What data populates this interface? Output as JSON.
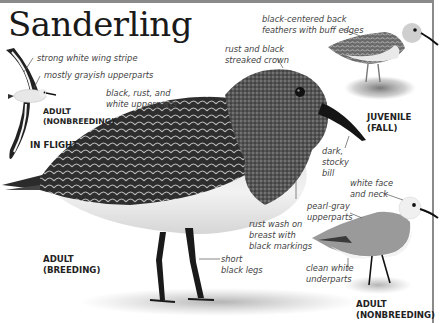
{
  "title": "Sanderling",
  "figures": {
    "in_flight": {
      "age_label": [
        "ADULT",
        "(NONBREEDING)"
      ],
      "mode_label": "IN FLIGHT",
      "callouts": [
        "strong white wing stripe",
        "mostly grayish upperparts"
      ]
    },
    "adult_breeding": {
      "label": [
        "ADULT",
        "(BREEDING)"
      ],
      "callouts": {
        "upperparts": [
          "black, rust, and",
          "white upperparts"
        ],
        "crown": [
          "rust and black",
          "streaked crown"
        ],
        "bill": [
          "dark,",
          "stocky",
          "bill"
        ],
        "breast": [
          "rust wash on",
          "breast with",
          "black markings"
        ],
        "legs": [
          "short",
          "black legs"
        ]
      }
    },
    "juvenile": {
      "label": [
        "JUVENILE",
        "(FALL)"
      ],
      "callouts": {
        "back": [
          "black-centered back",
          "feathers with buff edges"
        ]
      }
    },
    "adult_nonbreeding": {
      "label": [
        "ADULT",
        "(NONBREEDING)"
      ],
      "callouts": {
        "face": [
          "white face",
          "and neck"
        ],
        "upperparts": [
          "pearl-gray",
          "upperparts"
        ],
        "underparts": [
          "clean white",
          "underparts"
        ]
      }
    }
  },
  "colors": {
    "border": "#8a8a8a",
    "title": "#1a1a1a",
    "callout_text": "#444444",
    "label_text": "#222222"
  }
}
